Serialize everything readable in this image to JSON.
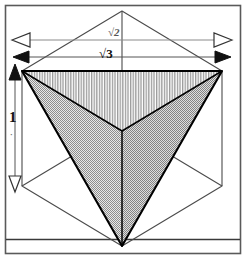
{
  "figure": {
    "background_color": "#ffffff",
    "width": 246,
    "height": 259,
    "frame": {
      "outer_border_color": "#555555",
      "rule_color": "#333333"
    }
  },
  "dimensions": {
    "diagonal_face": {
      "label": "√2",
      "arrowhead_style": "hollow",
      "orientation": "horizontal",
      "color": "#777777"
    },
    "diagonal_space": {
      "label": "√3",
      "arrowhead_style": "filled",
      "orientation": "horizontal",
      "color": "#111111"
    },
    "edge_vertical": {
      "label": "1",
      "sublabel": "·",
      "arrowhead_style": "filled-top-hollow-bottom",
      "orientation": "vertical",
      "color": "#111111"
    }
  },
  "solid": {
    "name": "tetrahedron",
    "faces": [
      {
        "name": "top-face",
        "fill_pattern": "vertical-hatch",
        "fill_color": "#b4b4b4"
      },
      {
        "name": "left-face",
        "fill_pattern": "stipple",
        "fill_color": "#9e9e9e"
      },
      {
        "name": "right-face",
        "fill_pattern": "stipple",
        "fill_color": "#a8a8a8"
      }
    ],
    "edge_color": "#000000"
  },
  "cube": {
    "name": "bounding-cube",
    "edge_color": "#4a4a4a",
    "fill": "none"
  }
}
